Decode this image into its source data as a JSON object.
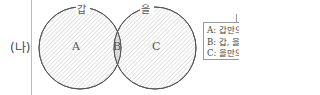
{
  "row_label": "(나)",
  "venn": {
    "sets": [
      {
        "name": "갑",
        "region_label": "A"
      },
      {
        "name": "을",
        "region_label": "C"
      }
    ],
    "intersection_label": "B"
  },
  "legend": {
    "items": [
      "A: 갑만의",
      "B: 갑, 을",
      "C: 을만의"
    ]
  },
  "colors": {
    "stroke": "#555555",
    "hatch": "#bbbbbb",
    "intersection_fill": "#d9d9d9"
  }
}
